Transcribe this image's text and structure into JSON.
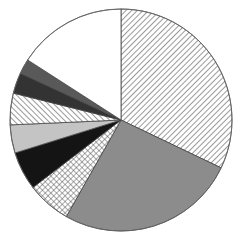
{
  "chart_data": {
    "type": "pie",
    "title": "",
    "legend": [],
    "start_angle_deg": 0,
    "direction": "clockwise",
    "center": [
      121,
      120
    ],
    "radius": 111,
    "slices": [
      {
        "label": "",
        "value": 32.1,
        "fill": "hatch-back",
        "color": "#ffffff",
        "line": "#555555"
      },
      {
        "label": "",
        "value": 26.1,
        "fill": "solid",
        "color": "#8c8c8c"
      },
      {
        "label": "",
        "value": 6.4,
        "fill": "crosshatch",
        "color": "#ffffff",
        "line": "#555555"
      },
      {
        "label": "",
        "value": 5.6,
        "fill": "solid",
        "color": "#141414"
      },
      {
        "label": "",
        "value": 4.1,
        "fill": "solid",
        "color": "#c4c4c4"
      },
      {
        "label": "",
        "value": 4.6,
        "fill": "hatch-fwd",
        "color": "#ffffff",
        "line": "#555555"
      },
      {
        "label": "",
        "value": 3.0,
        "fill": "solid",
        "color": "#333333"
      },
      {
        "label": "",
        "value": 2.2,
        "fill": "solid",
        "color": "#595959"
      },
      {
        "label": "",
        "value": 15.9,
        "fill": "solid",
        "color": "#ffffff"
      }
    ]
  }
}
